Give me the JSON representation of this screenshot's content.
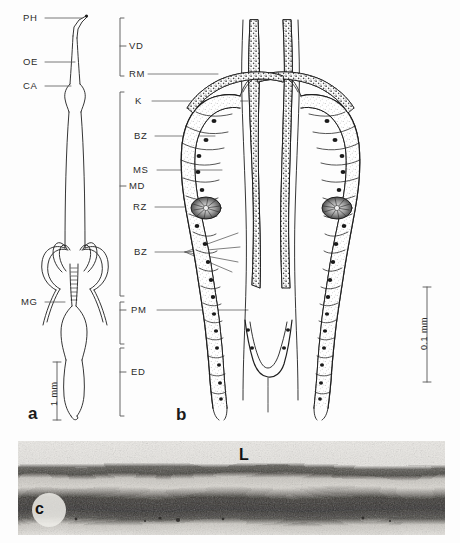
{
  "figure": {
    "panels": [
      {
        "id": "a",
        "label": "a",
        "description": "whole-mount line drawing of digestive tract",
        "scale_bar": "1 mm",
        "labels": [
          {
            "code": "PH",
            "name": "pharynx"
          },
          {
            "code": "OE",
            "name": "oesophagus"
          },
          {
            "code": "CA",
            "name": "cardia"
          },
          {
            "code": "MG",
            "name": "midgut"
          }
        ]
      },
      {
        "id": "b",
        "label": "b",
        "description": "histological drawing of paired tubular glands with epithelium",
        "scale_bar": "0.1 mm",
        "brackets": [
          {
            "code": "VD",
            "name": "vas deferens"
          },
          {
            "code": "MD",
            "name": "mid duct"
          },
          {
            "code": "PM",
            "name": "pars media"
          },
          {
            "code": "ED",
            "name": "ejaculatory duct"
          }
        ],
        "labels": [
          {
            "code": "RM",
            "name": "ring muscle"
          },
          {
            "code": "K",
            "name": "kern / nucleus"
          },
          {
            "code": "BZ",
            "name": "basal zone upper"
          },
          {
            "code": "MS",
            "name": "muscle sheath"
          },
          {
            "code": "RZ",
            "name": "rosette zone"
          },
          {
            "code": "BZ",
            "name": "basal zone lower"
          }
        ]
      },
      {
        "id": "c",
        "label": "c",
        "description": "grayscale electron micrograph of layered membrane",
        "labels": [
          {
            "code": "L",
            "name": "lumen"
          }
        ]
      }
    ]
  },
  "colors": {
    "background": "#fdfdfd",
    "ink": "#1a1a1a",
    "label_text": "#2b2b2b",
    "micrograph_light": "#e9e9e7",
    "micrograph_dark": "#3a3a38"
  }
}
